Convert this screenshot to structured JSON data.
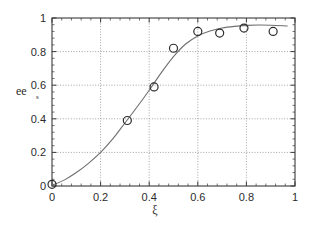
{
  "chart_data": {
    "type": "scatter",
    "title": "",
    "xlabel": "ξ",
    "ylabel": "ee_s",
    "ylabel_base": "ee",
    "ylabel_sub": "s",
    "xlim": [
      0,
      1
    ],
    "ylim": [
      0,
      1
    ],
    "grid": true,
    "legend": "none",
    "xticks": [
      0,
      0.2,
      0.4,
      0.6,
      0.8,
      1
    ],
    "xticklabels": [
      "0",
      "0.2",
      "0.4",
      "0.6",
      "0.8",
      "1"
    ],
    "yticks": [
      0,
      0.2,
      0.4,
      0.6,
      0.8,
      1
    ],
    "yticklabels": [
      "0",
      "0.2",
      "0.4",
      "0.6",
      "0.8",
      "1"
    ],
    "minor_ticks_per_interval": 5,
    "series": [
      {
        "name": "measured",
        "style": "open-circle-markers",
        "marker_size": 4,
        "color": "#2b2b2b",
        "points": [
          {
            "x": 0.0,
            "y": 0.01
          },
          {
            "x": 0.31,
            "y": 0.39
          },
          {
            "x": 0.42,
            "y": 0.59
          },
          {
            "x": 0.5,
            "y": 0.82
          },
          {
            "x": 0.6,
            "y": 0.92
          },
          {
            "x": 0.69,
            "y": 0.91
          },
          {
            "x": 0.79,
            "y": 0.94
          },
          {
            "x": 0.91,
            "y": 0.92
          }
        ]
      },
      {
        "name": "model fit",
        "style": "solid-line",
        "color": "#6f6f6f",
        "points": [
          {
            "x": 0.0,
            "y": 0.005
          },
          {
            "x": 0.05,
            "y": 0.035
          },
          {
            "x": 0.1,
            "y": 0.08
          },
          {
            "x": 0.15,
            "y": 0.135
          },
          {
            "x": 0.2,
            "y": 0.2
          },
          {
            "x": 0.25,
            "y": 0.28
          },
          {
            "x": 0.3,
            "y": 0.375
          },
          {
            "x": 0.35,
            "y": 0.47
          },
          {
            "x": 0.4,
            "y": 0.57
          },
          {
            "x": 0.45,
            "y": 0.675
          },
          {
            "x": 0.5,
            "y": 0.77
          },
          {
            "x": 0.55,
            "y": 0.845
          },
          {
            "x": 0.6,
            "y": 0.893
          },
          {
            "x": 0.65,
            "y": 0.922
          },
          {
            "x": 0.7,
            "y": 0.94
          },
          {
            "x": 0.75,
            "y": 0.95
          },
          {
            "x": 0.8,
            "y": 0.956
          },
          {
            "x": 0.85,
            "y": 0.958
          },
          {
            "x": 0.9,
            "y": 0.957
          },
          {
            "x": 0.95,
            "y": 0.954
          },
          {
            "x": 0.97,
            "y": 0.952
          }
        ]
      }
    ]
  }
}
